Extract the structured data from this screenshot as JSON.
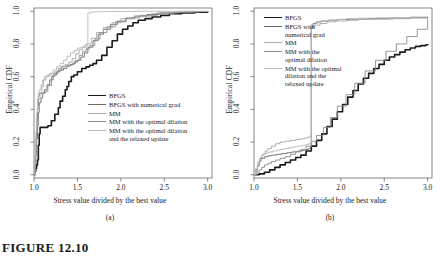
{
  "figure": {
    "number_label": "FIGURE 12.10",
    "panels": [
      {
        "key": "a",
        "subcaption": "(a)"
      },
      {
        "key": "b",
        "subcaption": "(b)"
      }
    ]
  },
  "series_colors": [
    "#1a1a1a",
    "#6b6b6b",
    "#a8a8a8",
    "#8c8c8c",
    "#b9b9b9"
  ],
  "series_widths": [
    1.6,
    0.9,
    0.9,
    0.9,
    0.9
  ],
  "legend_a": {
    "items": [
      "BFGS",
      "BFGS with numerical grad",
      "MM",
      "MM with the optimal dilation",
      "MM with the optimal dilation\nand the relaxed update"
    ]
  },
  "legend_b": {
    "items": [
      "BFGS",
      "BFGS with\nnumerical grad",
      "MM",
      "MM with the\noptimal dilation",
      "MM with the optimal\ndilation and the\nrelaxed update"
    ]
  },
  "chart_data": [
    {
      "type": "line",
      "panel": "a",
      "title": "",
      "xlabel": "Stress value divided by the best value",
      "ylabel": "Empirical CDF",
      "xlim": [
        1.0,
        3.05
      ],
      "ylim": [
        -0.02,
        1.02
      ],
      "xticks": [
        1.0,
        1.5,
        2.0,
        2.5,
        3.0
      ],
      "xticklabels": [
        "1.0",
        "1.5",
        "2.0",
        "2.5",
        "3.0"
      ],
      "yticks": [
        0.0,
        0.2,
        0.4,
        0.6,
        0.8,
        1.0
      ],
      "yticklabels": [
        "0.0",
        "0.2",
        "0.4",
        "0.6",
        "0.8",
        "1.0"
      ],
      "grid": false,
      "legend_position": "center",
      "series": [
        {
          "name": "BFGS",
          "x": [
            1.0,
            1.01,
            1.02,
            1.03,
            1.04,
            1.05,
            1.06,
            1.07,
            1.08,
            1.09,
            1.1,
            1.12,
            1.16,
            1.2,
            1.24,
            1.28,
            1.3,
            1.33,
            1.36,
            1.38,
            1.4,
            1.43,
            1.46,
            1.5,
            1.55,
            1.6,
            1.64,
            1.68,
            1.72,
            1.78,
            1.84,
            1.9,
            1.96,
            2.02,
            2.08,
            2.14,
            2.2,
            2.28,
            2.36,
            2.46,
            2.56,
            2.7,
            2.85,
            3.0
          ],
          "y": [
            0.0,
            0.02,
            0.04,
            0.06,
            0.09,
            0.18,
            0.25,
            0.29,
            0.29,
            0.29,
            0.29,
            0.29,
            0.3,
            0.33,
            0.37,
            0.41,
            0.45,
            0.48,
            0.52,
            0.54,
            0.57,
            0.6,
            0.61,
            0.63,
            0.65,
            0.66,
            0.67,
            0.68,
            0.7,
            0.73,
            0.78,
            0.82,
            0.86,
            0.89,
            0.91,
            0.93,
            0.945,
            0.955,
            0.965,
            0.975,
            0.985,
            0.99,
            0.995,
            1.0
          ]
        },
        {
          "name": "BFGS with numerical grad",
          "x": [
            1.0,
            1.01,
            1.02,
            1.03,
            1.04,
            1.05,
            1.06,
            1.08,
            1.1,
            1.12,
            1.15,
            1.18,
            1.22,
            1.26,
            1.3,
            1.34,
            1.38,
            1.42,
            1.46,
            1.5,
            1.54,
            1.58,
            1.62,
            1.68,
            1.74,
            1.8,
            1.88,
            1.96,
            2.06,
            2.16,
            2.3,
            2.46,
            2.64,
            2.82,
            3.0
          ],
          "y": [
            0.0,
            0.05,
            0.12,
            0.22,
            0.3,
            0.38,
            0.44,
            0.47,
            0.5,
            0.52,
            0.55,
            0.58,
            0.61,
            0.63,
            0.64,
            0.65,
            0.665,
            0.675,
            0.69,
            0.7,
            0.72,
            0.745,
            0.78,
            0.82,
            0.86,
            0.89,
            0.92,
            0.94,
            0.955,
            0.97,
            0.98,
            0.99,
            0.995,
            0.998,
            1.0
          ]
        },
        {
          "name": "MM",
          "x": [
            1.0,
            1.01,
            1.02,
            1.03,
            1.04,
            1.05,
            1.07,
            1.09,
            1.11,
            1.14,
            1.17,
            1.2,
            1.24,
            1.28,
            1.32,
            1.36,
            1.4,
            1.44,
            1.48,
            1.52,
            1.56,
            1.6,
            1.66,
            1.72,
            1.8,
            1.9,
            2.0,
            2.15,
            2.35,
            2.6,
            2.85,
            3.0
          ],
          "y": [
            0.0,
            0.08,
            0.18,
            0.3,
            0.4,
            0.46,
            0.5,
            0.54,
            0.58,
            0.6,
            0.61,
            0.62,
            0.63,
            0.65,
            0.665,
            0.675,
            0.69,
            0.71,
            0.74,
            0.765,
            0.78,
            0.8,
            0.835,
            0.87,
            0.9,
            0.93,
            0.955,
            0.97,
            0.985,
            0.995,
            0.999,
            1.0
          ]
        },
        {
          "name": "MM with the optimal dilation",
          "x": [
            1.0,
            1.01,
            1.02,
            1.03,
            1.04,
            1.05,
            1.06,
            1.08,
            1.1,
            1.13,
            1.16,
            1.2,
            1.24,
            1.28,
            1.32,
            1.36,
            1.4,
            1.44,
            1.48,
            1.52,
            1.56,
            1.6,
            1.64,
            1.7,
            1.76,
            1.84,
            1.94,
            2.06,
            2.22,
            2.42,
            2.66,
            2.9,
            3.0
          ],
          "y": [
            0.0,
            0.1,
            0.22,
            0.34,
            0.42,
            0.48,
            0.5,
            0.5,
            0.5,
            0.51,
            0.545,
            0.6,
            0.62,
            0.64,
            0.66,
            0.665,
            0.67,
            0.68,
            0.7,
            0.73,
            0.755,
            0.77,
            0.79,
            0.83,
            0.87,
            0.905,
            0.935,
            0.96,
            0.975,
            0.99,
            0.996,
            0.999,
            1.0
          ]
        },
        {
          "name": "MM with the optimal dilation and the relaxed update",
          "x": [
            1.0,
            1.01,
            1.02,
            1.03,
            1.04,
            1.05,
            1.06,
            1.08,
            1.1,
            1.12,
            1.15,
            1.18,
            1.22,
            1.26,
            1.3,
            1.34,
            1.38,
            1.42,
            1.46,
            1.5,
            1.54,
            1.58,
            1.62,
            1.66,
            1.7,
            1.78,
            1.88,
            2.0,
            2.16,
            2.36,
            2.6,
            2.85,
            3.0
          ],
          "y": [
            0.0,
            0.12,
            0.26,
            0.38,
            0.46,
            0.5,
            0.52,
            0.55,
            0.58,
            0.6,
            0.61,
            0.62,
            0.64,
            0.66,
            0.68,
            0.7,
            0.725,
            0.745,
            0.76,
            0.775,
            0.78,
            0.79,
            0.99,
            0.995,
            0.997,
            0.998,
            0.999,
            0.999,
            1.0,
            1.0,
            1.0,
            1.0,
            1.0
          ]
        }
      ]
    },
    {
      "type": "line",
      "panel": "b",
      "title": "",
      "xlabel": "Stress value divided by the best value",
      "ylabel": "Empirical CDF",
      "xlim": [
        1.0,
        3.05
      ],
      "ylim": [
        -0.02,
        1.02
      ],
      "xticks": [
        1.0,
        1.5,
        2.0,
        2.5,
        3.0
      ],
      "xticklabels": [
        "1.0",
        "1.5",
        "2.0",
        "2.5",
        "3.0"
      ],
      "yticks": [
        0.0,
        0.2,
        0.4,
        0.6,
        0.8,
        1.0
      ],
      "yticklabels": [
        "0.0",
        "0.2",
        "0.4",
        "0.6",
        "0.8",
        "1.0"
      ],
      "grid": false,
      "legend_position": "upper left",
      "series": [
        {
          "name": "BFGS",
          "x": [
            1.0,
            1.06,
            1.12,
            1.18,
            1.24,
            1.3,
            1.36,
            1.42,
            1.48,
            1.54,
            1.6,
            1.66,
            1.72,
            1.78,
            1.84,
            1.9,
            1.96,
            2.02,
            2.08,
            2.14,
            2.2,
            2.26,
            2.32,
            2.38,
            2.44,
            2.5,
            2.56,
            2.62,
            2.68,
            2.74,
            2.8,
            2.86,
            2.92,
            2.98,
            3.0
          ],
          "y": [
            0.0,
            0.005,
            0.015,
            0.03,
            0.045,
            0.06,
            0.075,
            0.09,
            0.105,
            0.12,
            0.145,
            0.175,
            0.21,
            0.25,
            0.295,
            0.34,
            0.385,
            0.43,
            0.475,
            0.515,
            0.555,
            0.59,
            0.62,
            0.65,
            0.675,
            0.7,
            0.72,
            0.735,
            0.75,
            0.765,
            0.775,
            0.785,
            0.79,
            0.795,
            0.8
          ]
        },
        {
          "name": "BFGS with numerical grad",
          "x": [
            1.0,
            1.02,
            1.04,
            1.06,
            1.08,
            1.12,
            1.16,
            1.2,
            1.26,
            1.32,
            1.38,
            1.44,
            1.5,
            1.56,
            1.6,
            1.63,
            1.65,
            1.66,
            1.68,
            1.72,
            1.78,
            1.86,
            1.96,
            2.1,
            2.3,
            2.55,
            2.8,
            3.0
          ],
          "y": [
            0.0,
            0.03,
            0.06,
            0.085,
            0.1,
            0.11,
            0.115,
            0.12,
            0.125,
            0.13,
            0.135,
            0.14,
            0.145,
            0.15,
            0.155,
            0.16,
            0.17,
            0.9,
            0.925,
            0.935,
            0.94,
            0.945,
            0.95,
            0.952,
            0.955,
            0.958,
            0.962,
            0.965
          ]
        },
        {
          "name": "MM",
          "x": [
            1.0,
            1.02,
            1.04,
            1.06,
            1.08,
            1.1,
            1.13,
            1.16,
            1.2,
            1.25,
            1.3,
            1.36,
            1.42,
            1.48,
            1.54,
            1.58,
            1.62,
            1.65,
            1.66,
            1.7,
            1.76,
            1.84,
            1.94,
            2.06,
            2.2,
            2.4,
            2.6,
            2.8,
            3.0
          ],
          "y": [
            0.0,
            0.02,
            0.05,
            0.08,
            0.105,
            0.125,
            0.145,
            0.16,
            0.175,
            0.19,
            0.2,
            0.205,
            0.21,
            0.215,
            0.22,
            0.225,
            0.23,
            0.24,
            0.9,
            0.915,
            0.925,
            0.935,
            0.94,
            0.945,
            0.95,
            0.952,
            0.955,
            0.958,
            0.96
          ]
        },
        {
          "name": "MM with the optimal dilation",
          "x": [
            1.0,
            1.03,
            1.06,
            1.09,
            1.12,
            1.16,
            1.2,
            1.25,
            1.3,
            1.36,
            1.42,
            1.48,
            1.54,
            1.6,
            1.66,
            1.72,
            1.8,
            1.88,
            1.96,
            2.06,
            2.16,
            2.28,
            2.4,
            2.52,
            2.64,
            2.76,
            2.88,
            3.0
          ],
          "y": [
            0.0,
            0.015,
            0.03,
            0.045,
            0.06,
            0.07,
            0.08,
            0.09,
            0.1,
            0.11,
            0.125,
            0.14,
            0.155,
            0.175,
            0.205,
            0.24,
            0.29,
            0.35,
            0.42,
            0.49,
            0.56,
            0.635,
            0.7,
            0.755,
            0.8,
            0.845,
            0.89,
            0.955
          ]
        },
        {
          "name": "MM with the optimal dilation and the relaxed update",
          "x": [
            1.0,
            1.02,
            1.04,
            1.06,
            1.08,
            1.1,
            1.12,
            1.15,
            1.18,
            1.22,
            1.26,
            1.3,
            1.35,
            1.4,
            1.45,
            1.5,
            1.55,
            1.6,
            1.63,
            1.65,
            1.66,
            1.7,
            1.76,
            1.84,
            1.94,
            2.06,
            2.2,
            2.4,
            2.6,
            2.8,
            3.0
          ],
          "y": [
            0.0,
            0.04,
            0.075,
            0.1,
            0.115,
            0.125,
            0.13,
            0.135,
            0.14,
            0.145,
            0.15,
            0.155,
            0.16,
            0.165,
            0.17,
            0.175,
            0.18,
            0.185,
            0.19,
            0.195,
            0.92,
            0.93,
            0.94,
            0.945,
            0.95,
            0.955,
            0.958,
            0.96,
            0.962,
            0.965,
            0.968
          ]
        }
      ]
    }
  ]
}
